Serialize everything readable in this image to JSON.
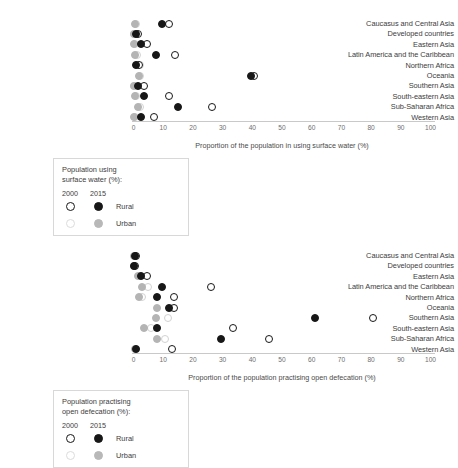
{
  "chart_data": [
    {
      "type": "scatter",
      "id": "surface-water",
      "title": "",
      "xlabel": "Proportion of the population in using surface water (%)",
      "ylabel": "",
      "xlim": [
        0,
        100
      ],
      "xticks": [
        0,
        10,
        20,
        30,
        40,
        50,
        60,
        70,
        80,
        90,
        100
      ],
      "grid": false,
      "legend_position": "below-left",
      "categories": [
        "Caucasus and Central Asia",
        "Developed countries",
        "Eastern Asia",
        "Latin America and the Caribbean",
        "Northern Africa",
        "Oceania",
        "Southern Asia",
        "South-eastern Asia",
        "Sub-Saharan Africa",
        "Western Asia"
      ],
      "series": [
        {
          "name": "Rural 2000",
          "marker": "open-black",
          "values": [
            12.0,
            1.5,
            4.5,
            14.0,
            2.0,
            40.5,
            3.5,
            12.0,
            26.5,
            7.0
          ]
        },
        {
          "name": "Rural 2015",
          "marker": "filled-black",
          "values": [
            9.5,
            1.0,
            2.5,
            7.5,
            1.0,
            39.5,
            1.5,
            3.5,
            15.0,
            2.5
          ]
        },
        {
          "name": "Urban 2000",
          "marker": "open-gray",
          "values": [
            0.8,
            0.2,
            0.4,
            1.2,
            2.2,
            2.2,
            0.3,
            1.0,
            2.2,
            0.5
          ]
        },
        {
          "name": "Urban 2015",
          "marker": "filled-gray",
          "values": [
            0.5,
            0.1,
            0.2,
            0.6,
            1.2,
            1.8,
            0.2,
            0.4,
            1.5,
            0.3
          ]
        }
      ]
    },
    {
      "type": "scatter",
      "id": "open-defecation",
      "title": "",
      "xlabel": "Proportion of the population practising open defecation (%)",
      "ylabel": "",
      "xlim": [
        0,
        100
      ],
      "xticks": [
        0,
        10,
        20,
        30,
        40,
        50,
        60,
        70,
        80,
        90,
        100
      ],
      "grid": false,
      "legend_position": "below-left",
      "categories": [
        "Caucasus and Central Asia",
        "Developed countries",
        "Eastern Asia",
        "Latin America and the Caribbean",
        "Northern Africa",
        "Oceania",
        "Southern Asia",
        "South-eastern Asia",
        "Sub-Saharan Africa",
        "Western Asia"
      ],
      "series": [
        {
          "name": "Rural 2000",
          "marker": "open-black",
          "values": [
            0.8,
            0.5,
            4.5,
            26.0,
            13.5,
            13.5,
            80.5,
            33.5,
            45.5,
            13.0
          ]
        },
        {
          "name": "Rural 2015",
          "marker": "filled-black",
          "values": [
            0.5,
            0.3,
            2.5,
            9.5,
            8.0,
            12.0,
            61.0,
            8.0,
            29.5,
            1.0
          ]
        },
        {
          "name": "Urban 2000",
          "marker": "open-gray",
          "values": [
            0.4,
            0.2,
            2.2,
            5.0,
            3.0,
            12.5,
            11.5,
            6.0,
            10.5,
            0.8
          ]
        },
        {
          "name": "Urban 2015",
          "marker": "filled-gray",
          "values": [
            0.2,
            0.1,
            1.5,
            3.0,
            2.0,
            8.0,
            7.5,
            3.5,
            8.0,
            0.4
          ]
        }
      ]
    }
  ],
  "panels": [
    {
      "id": "surface-water",
      "axis_title": "Proportion of the population in using surface water (%)",
      "legend": {
        "title_line1": "Population using",
        "title_line2": "surface water (%):",
        "col_2000": "2000",
        "col_2015": "2015",
        "row_rural": "Rural",
        "row_urban": "Urban"
      }
    },
    {
      "id": "open-defecation",
      "axis_title": "Proportion of the population practising open defecation (%)",
      "legend": {
        "title_line1": "Population practising",
        "title_line2": "open defecation (%):",
        "col_2000": "2000",
        "col_2015": "2015",
        "row_rural": "Rural",
        "row_urban": "Urban"
      }
    }
  ],
  "colors": {
    "rural": "#171717",
    "urban": "#b4b4b4",
    "axis": "#c9c9c9",
    "text": "#3c3c3c",
    "tick_text": "#6e6e6e",
    "legend_border": "#d8d8d8"
  }
}
